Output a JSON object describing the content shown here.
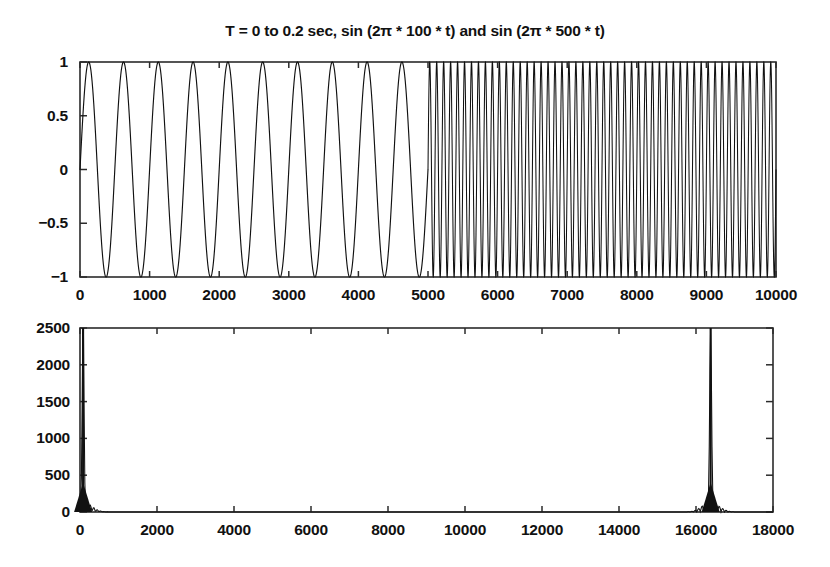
{
  "figure": {
    "title": "T = 0 to 0.2 sec, sin (2π * 100 * t) and sin (2π * 500 * t)",
    "background": "#ffffff",
    "line_color": "#111111",
    "axis_color": "#2b2b2b",
    "width": 830,
    "height": 567
  },
  "chart_data": [
    {
      "type": "line",
      "name": "time-domain-signal",
      "title": "T = 0 to 0.2 sec, sin (2π * 100 * t) and sin (2π * 500 * t)",
      "xlabel": "",
      "ylabel": "",
      "xlim": [
        0,
        10000
      ],
      "ylim": [
        -1,
        1
      ],
      "grid": false,
      "legend": "none",
      "xticks": [
        0,
        1000,
        2000,
        3000,
        4000,
        5000,
        6000,
        7000,
        8000,
        9000,
        10000
      ],
      "xtick_labels": [
        "0",
        "1000",
        "2000",
        "3000",
        "4000",
        "5000",
        "6000",
        "7000",
        "8000",
        "9000",
        "10000"
      ],
      "yticks": [
        -1,
        -0.5,
        0,
        0.5,
        1
      ],
      "ytick_labels": [
        "-1",
        "-0.5",
        "0",
        "0.5",
        "1"
      ],
      "description": "Concatenation of two sine bursts: samples 0-5000 contain sin(2*pi*100*t) showing 10 cycles, samples 5000-10000 contain sin(2*pi*500*t) showing 50 cycles. Amplitude 1, sample rate 50000 Hz, total duration 0.2 sec.",
      "segments": [
        {
          "name": "sin 100 Hz",
          "x_start": 0,
          "x_end": 5000,
          "frequency_hz": 100,
          "cycles": 10,
          "amplitude": 1
        },
        {
          "name": "sin 500 Hz",
          "x_start": 5000,
          "x_end": 10000,
          "frequency_hz": 500,
          "cycles": 50,
          "amplitude": 1
        }
      ]
    },
    {
      "type": "line",
      "name": "fft-magnitude-spectrum",
      "title": "",
      "xlabel": "",
      "ylabel": "",
      "xlim": [
        0,
        18000
      ],
      "ylim": [
        0,
        2500
      ],
      "grid": false,
      "legend": "none",
      "xticks": [
        0,
        2000,
        4000,
        6000,
        8000,
        10000,
        12000,
        14000,
        16000,
        18000
      ],
      "xtick_labels": [
        "0",
        "2000",
        "4000",
        "6000",
        "8000",
        "10000",
        "12000",
        "14000",
        "16000",
        "18000"
      ],
      "yticks": [
        0,
        500,
        1000,
        1500,
        2000,
        2500
      ],
      "ytick_labels": [
        "0",
        "500",
        "1000",
        "1500",
        "2000",
        "2500"
      ],
      "description": "Magnitude spectrum with two narrow peaks: one at the low-frequency edge near bin 80 reaching about 2500, and a mirrored peak near bin 16400 also reaching about 2500. Baseline is essentially zero elsewhere.",
      "peaks": [
        {
          "x": 80,
          "y": 2500,
          "width": 60,
          "label": "low-frequency peak"
        },
        {
          "x": 16380,
          "y": 2500,
          "width": 60,
          "label": "mirror high-frequency peak"
        }
      ],
      "baseline": 0
    }
  ],
  "top_plot": {
    "ytick_labels": [
      "1",
      "0.5",
      "0",
      "-0.5",
      "-1"
    ],
    "xtick_labels": [
      "0",
      "1000",
      "2000",
      "3000",
      "4000",
      "5000",
      "6000",
      "7000",
      "8000",
      "9000",
      "10000"
    ]
  },
  "bottom_plot": {
    "ytick_labels": [
      "2500",
      "2000",
      "1500",
      "1000",
      "500",
      "0"
    ],
    "xtick_labels": [
      "0",
      "2000",
      "4000",
      "6000",
      "8000",
      "10000",
      "12000",
      "14000",
      "16000",
      "18000"
    ]
  }
}
